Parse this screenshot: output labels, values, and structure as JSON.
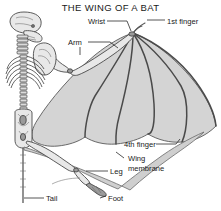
{
  "figure": {
    "title": "THE WING OF A BAT",
    "background_color": "#ffffff",
    "membrane_color": "#d4d4d4",
    "bone_color": "#e8e8e8",
    "outline_color": "#4a4a4a",
    "text_color": "#1a1a1a"
  },
  "labels": [
    {
      "id": "wrist",
      "text": "Wrist",
      "x": 88,
      "y": 23
    },
    {
      "id": "first-finger",
      "text": "1st finger",
      "x": 167,
      "y": 23
    },
    {
      "id": "arm",
      "text": "Arm",
      "x": 73,
      "y": 44
    },
    {
      "id": "fourth-finger",
      "text": "4th finger",
      "x": 124,
      "y": 146
    },
    {
      "id": "wing-membrane-1",
      "text": "Wing",
      "x": 126,
      "y": 160
    },
    {
      "id": "wing-membrane-2",
      "text": "membrane",
      "x": 126,
      "y": 170
    },
    {
      "id": "leg",
      "text": "Leg",
      "x": 110,
      "y": 173
    },
    {
      "id": "tail",
      "text": "Tail",
      "x": 46,
      "y": 200
    },
    {
      "id": "foot",
      "text": "Foot",
      "x": 102,
      "y": 200
    }
  ],
  "anatomy_parts": [
    "skull",
    "cervical-vertebrae",
    "ribcage",
    "spine",
    "pelvis",
    "humerus",
    "radius",
    "wrist-carpals",
    "first-finger",
    "second-finger",
    "third-finger",
    "fourth-finger",
    "fifth-finger",
    "wing-membrane",
    "leg",
    "foot",
    "tail"
  ]
}
